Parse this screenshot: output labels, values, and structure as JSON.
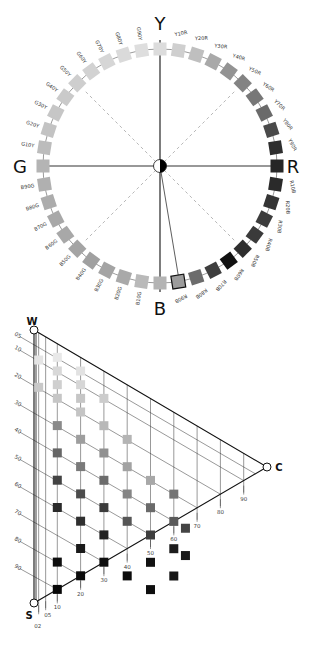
{
  "hue_circle": {
    "center": [
      160,
      166
    ],
    "radius": 117,
    "axes": {
      "top": "Y",
      "right": "R",
      "bottom": "B",
      "left": "G"
    },
    "hues": [
      {
        "label": "Y",
        "color": "#dcdcdc"
      },
      {
        "label": "Y10R",
        "color": "#cfcfcf"
      },
      {
        "label": "Y20R",
        "color": "#bfbfbf"
      },
      {
        "label": "Y30R",
        "color": "#a9a9a9"
      },
      {
        "label": "Y40R",
        "color": "#939393"
      },
      {
        "label": "Y50R",
        "color": "#838383"
      },
      {
        "label": "Y60R",
        "color": "#777777"
      },
      {
        "label": "Y70R",
        "color": "#6a6a6a"
      },
      {
        "label": "Y80R",
        "color": "#4a4a4a"
      },
      {
        "label": "Y90R",
        "color": "#2e2e2e"
      },
      {
        "label": "R",
        "color": "#262626"
      },
      {
        "label": "R10B",
        "color": "#2a2a2a"
      },
      {
        "label": "R20B",
        "color": "#343434"
      },
      {
        "label": "R30B",
        "color": "#3c3c3c"
      },
      {
        "label": "R40B",
        "color": "#3a3a3a"
      },
      {
        "label": "R50B",
        "color": "#2e2e2e"
      },
      {
        "label": "R60B",
        "color": "#111111"
      },
      {
        "label": "R70B",
        "color": "#3e3e3e"
      },
      {
        "label": "R80B",
        "color": "#6c6c6c"
      },
      {
        "label": "R90B",
        "color": "#9c9c9c",
        "highlight": true
      },
      {
        "label": "B",
        "color": "#b4b4b4"
      },
      {
        "label": "B10G",
        "color": "#b9b9b9"
      },
      {
        "label": "B20G",
        "color": "#a9a9a9"
      },
      {
        "label": "B30G",
        "color": "#a4a4a4"
      },
      {
        "label": "B40G",
        "color": "#a0a0a0"
      },
      {
        "label": "B50G",
        "color": "#a4a4a4"
      },
      {
        "label": "B60G",
        "color": "#a8a8a8"
      },
      {
        "label": "B70G",
        "color": "#a8a8a8"
      },
      {
        "label": "B80G",
        "color": "#acacac"
      },
      {
        "label": "B90G",
        "color": "#b0b0b0"
      },
      {
        "label": "G",
        "color": "#b4b4b4"
      },
      {
        "label": "G10Y",
        "color": "#bcbcbc"
      },
      {
        "label": "G20Y",
        "color": "#c3c3c3"
      },
      {
        "label": "G30Y",
        "color": "#c6c6c6"
      },
      {
        "label": "G40Y",
        "color": "#cacaca"
      },
      {
        "label": "G50Y",
        "color": "#cecece"
      },
      {
        "label": "G60Y",
        "color": "#d2d2d2"
      },
      {
        "label": "G70Y",
        "color": "#d6d6d6"
      },
      {
        "label": "G80Y",
        "color": "#dadada"
      },
      {
        "label": "G90Y",
        "color": "#dedede"
      }
    ],
    "selected_hue": "R90B"
  },
  "nuance_triangle": {
    "vertices": {
      "top": "W",
      "bottom": "S",
      "right": "C"
    },
    "blackness_ticks": [
      "05",
      "10",
      "20",
      "30",
      "40",
      "50",
      "60",
      "70",
      "80",
      "90"
    ],
    "chromaticness_ticks": [
      "02",
      "05",
      "10",
      "20",
      "30",
      "40",
      "50",
      "60",
      "70",
      "80",
      "90"
    ],
    "samples": [
      {
        "s": 5,
        "c": 10,
        "color": "#e8e8e8"
      },
      {
        "s": 5,
        "c": 20,
        "color": "#e2e2e2"
      },
      {
        "s": 10,
        "c": 2,
        "color": "#e4e4e4"
      },
      {
        "s": 10,
        "c": 10,
        "color": "#d8d8d8"
      },
      {
        "s": 10,
        "c": 20,
        "color": "#d6d6d6"
      },
      {
        "s": 10,
        "c": 30,
        "color": "#cccccc"
      },
      {
        "s": 15,
        "c": 10,
        "color": "#cfcfcf"
      },
      {
        "s": 15,
        "c": 20,
        "color": "#c6c6c6"
      },
      {
        "s": 20,
        "c": 2,
        "color": "#c8c8c8"
      },
      {
        "s": 20,
        "c": 10,
        "color": "#c6c6c6"
      },
      {
        "s": 20,
        "c": 20,
        "color": "#c4c4c4"
      },
      {
        "s": 20,
        "c": 30,
        "color": "#b8b8b8"
      },
      {
        "s": 20,
        "c": 40,
        "color": "#b4b4b4"
      },
      {
        "s": 30,
        "c": 20,
        "color": "#9e9e9e"
      },
      {
        "s": 30,
        "c": 40,
        "color": "#a2a2a2"
      },
      {
        "s": 30,
        "c": 50,
        "color": "#a8a8a8"
      },
      {
        "s": 30,
        "c": 10,
        "color": "#8a8a8a"
      },
      {
        "s": 40,
        "c": 20,
        "color": "#7a7a7a"
      },
      {
        "s": 30,
        "c": 30,
        "color": "#909090"
      },
      {
        "s": 40,
        "c": 40,
        "color": "#858585"
      },
      {
        "s": 40,
        "c": 10,
        "color": "#666666"
      },
      {
        "s": 40,
        "c": 30,
        "color": "#6c6c6c"
      },
      {
        "s": 40,
        "c": 50,
        "color": "#6a6a6a"
      },
      {
        "s": 30,
        "c": 60,
        "color": "#757575"
      },
      {
        "s": 40,
        "c": 60,
        "color": "#5a5a5a"
      },
      {
        "s": 40,
        "c": 65,
        "color": "#444444"
      },
      {
        "s": 50,
        "c": 20,
        "color": "#4c4c4c"
      },
      {
        "s": 50,
        "c": 40,
        "color": "#565656"
      },
      {
        "s": 50,
        "c": 10,
        "color": "#434343"
      },
      {
        "s": 50,
        "c": 30,
        "color": "#3c3c3c"
      },
      {
        "s": 50,
        "c": 50,
        "color": "#3e3e3e"
      },
      {
        "s": 60,
        "c": 20,
        "color": "#2f2f2f"
      },
      {
        "s": 50,
        "c": 60,
        "color": "#1c1c1c"
      },
      {
        "s": 50,
        "c": 65,
        "color": "#1a1a1a"
      },
      {
        "s": 60,
        "c": 10,
        "color": "#2a2a2a"
      },
      {
        "s": 60,
        "c": 30,
        "color": "#222222"
      },
      {
        "s": 60,
        "c": 50,
        "color": "#111111"
      },
      {
        "s": 60,
        "c": 60,
        "color": "#151515"
      },
      {
        "s": 70,
        "c": 20,
        "color": "#1a1a1a"
      },
      {
        "s": 70,
        "c": 40,
        "color": "#0c0c0c"
      },
      {
        "s": 70,
        "c": 50,
        "color": "#0e0e0e"
      },
      {
        "s": 80,
        "c": 10,
        "color": "#0e0e0e"
      },
      {
        "s": 70,
        "c": 30,
        "color": "#0f0f0f"
      },
      {
        "s": 80,
        "c": 20,
        "color": "#0b0b0b"
      },
      {
        "s": 90,
        "c": 10,
        "color": "#080808"
      }
    ]
  }
}
